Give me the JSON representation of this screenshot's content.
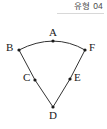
{
  "header": {
    "label": "유형 04",
    "rule_color": "#d8d8d8"
  },
  "figure": {
    "name": "circular-sector-diagram",
    "background": "#ffffff",
    "stroke_color": "#333333",
    "point_color": "#1a1a1a",
    "stroke_width": 1,
    "point_radius": 1.6,
    "arc": {
      "from": "B",
      "via": "A",
      "to": "F",
      "bulge": "up"
    },
    "segments": [
      {
        "from": "B",
        "to": "D",
        "via": "C"
      },
      {
        "from": "F",
        "to": "D",
        "via": "E"
      }
    ],
    "points": [
      {
        "id": "A",
        "label": "A",
        "x": 53,
        "y": 41,
        "label_x": 49,
        "label_y": 27
      },
      {
        "id": "B",
        "label": "B",
        "x": 19,
        "y": 50,
        "label_x": 6,
        "label_y": 42
      },
      {
        "id": "F",
        "label": "F",
        "x": 85,
        "y": 50,
        "label_x": 89,
        "label_y": 42
      },
      {
        "id": "C",
        "label": "C",
        "x": 35,
        "y": 80,
        "label_x": 23,
        "label_y": 72
      },
      {
        "id": "E",
        "label": "E",
        "x": 70,
        "y": 79,
        "label_x": 74,
        "label_y": 72
      },
      {
        "id": "D",
        "label": "D",
        "x": 53,
        "y": 107,
        "label_x": 49,
        "label_y": 110
      }
    ]
  }
}
